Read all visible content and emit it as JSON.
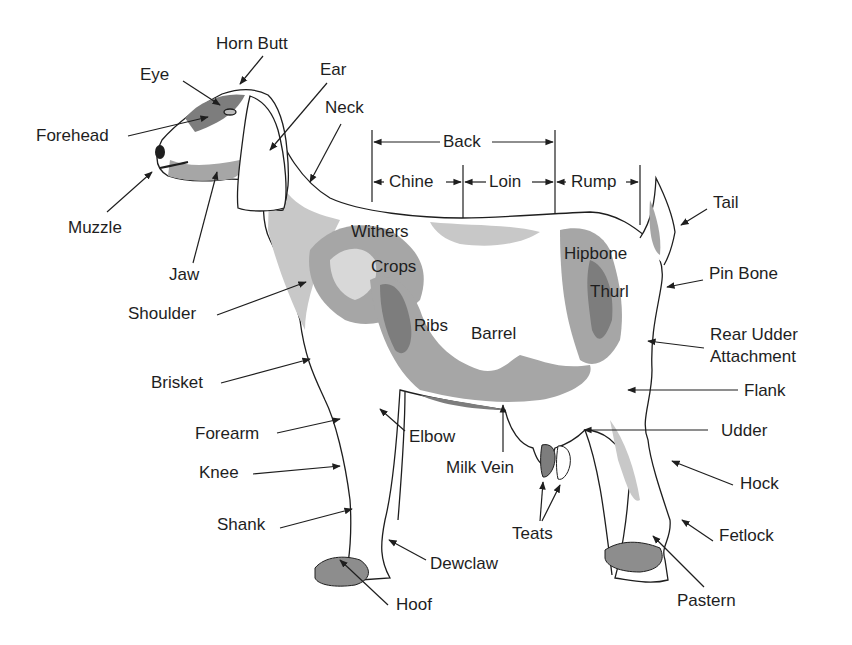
{
  "diagram": {
    "colors": {
      "outline": "#1e1e1e",
      "shade_light": "#c8c8c8",
      "shade_mid": "#a6a6a6",
      "shade_dark": "#7d7d7d",
      "background": "#ffffff"
    },
    "labels": {
      "horn_butt": "Horn Butt",
      "eye": "Eye",
      "ear": "Ear",
      "forehead": "Forehead",
      "neck": "Neck",
      "muzzle": "Muzzle",
      "jaw": "Jaw",
      "shoulder": "Shoulder",
      "withers": "Withers",
      "crops": "Crops",
      "ribs": "Ribs",
      "barrel": "Barrel",
      "hipbone": "Hipbone",
      "thurl": "Thurl",
      "back": "Back",
      "chine": "Chine",
      "loin": "Loin",
      "rump": "Rump",
      "tail": "Tail",
      "pin_bone": "Pin Bone",
      "rear_udder_attachment_line1": "Rear Udder",
      "rear_udder_attachment_line2": "Attachment",
      "flank": "Flank",
      "udder": "Udder",
      "hock": "Hock",
      "fetlock": "Fetlock",
      "pastern": "Pastern",
      "brisket": "Brisket",
      "forearm": "Forearm",
      "knee": "Knee",
      "shank": "Shank",
      "elbow": "Elbow",
      "milk_vein": "Milk Vein",
      "teats": "Teats",
      "dewclaw": "Dewclaw",
      "hoof": "Hoof"
    }
  }
}
